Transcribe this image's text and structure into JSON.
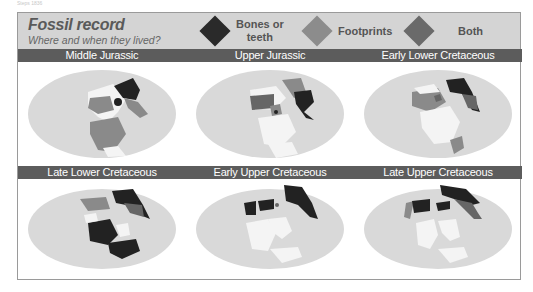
{
  "caption": "Steps 1836",
  "header": {
    "title": "Fossil record",
    "subtitle": "Where and when they lived?"
  },
  "legend": [
    {
      "label_line1": "Bones or",
      "label_line2": "teeth",
      "color": "#2a2a2a"
    },
    {
      "label_line1": "Footprints",
      "label_line2": "",
      "color": "#8c8c8c"
    },
    {
      "label_line1": "Both",
      "label_line2": "",
      "color": "#6a6a6a"
    }
  ],
  "colors": {
    "ocean": "#d9d9d9",
    "land": "#f4f4f4",
    "bones": "#222222",
    "footprints": "#8a8a8a",
    "both": "#666666",
    "title_bar": "#5c5c5c",
    "header_bg": "#d4d4d4"
  },
  "panels": [
    {
      "title": "Middle Jurassic"
    },
    {
      "title": "Upper Jurassic"
    },
    {
      "title": "Early Lower Cretaceous"
    },
    {
      "title": "Late Lower Cretaceous"
    },
    {
      "title": "Early Upper Cretaceous"
    },
    {
      "title": "Late Upper Cretaceous"
    }
  ]
}
